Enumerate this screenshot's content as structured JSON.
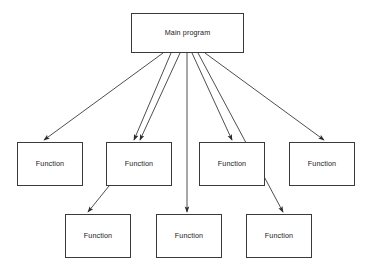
{
  "diagram": {
    "type": "flowchart-call-hierarchy",
    "title_text": "Main program",
    "background_color": "#ffffff",
    "line_color": "#3a3a3a",
    "text_color": "#1a1a1a",
    "root": {
      "id": "main-program",
      "label": "Main program",
      "x": 131,
      "y": 13,
      "w": 113,
      "h": 40
    },
    "middle_row": [
      {
        "id": "function-1",
        "label": "Function",
        "x": 17,
        "y": 142,
        "w": 66,
        "h": 44
      },
      {
        "id": "function-2",
        "label": "Function",
        "x": 106,
        "y": 142,
        "w": 66,
        "h": 44
      },
      {
        "id": "function-3",
        "label": "Function",
        "x": 199,
        "y": 142,
        "w": 66,
        "h": 44
      },
      {
        "id": "function-4",
        "label": "Function",
        "x": 289,
        "y": 142,
        "w": 66,
        "h": 44
      }
    ],
    "bottom_row": [
      {
        "id": "function-5",
        "label": "Function",
        "x": 65,
        "y": 214,
        "w": 66,
        "h": 44
      },
      {
        "id": "function-6",
        "label": "Function",
        "x": 156,
        "y": 214,
        "w": 66,
        "h": 44
      },
      {
        "id": "function-7",
        "label": "Function",
        "x": 246,
        "y": 214,
        "w": 66,
        "h": 44
      }
    ],
    "edges": [
      {
        "id": "edge-main-to-function-1",
        "from": "main-program",
        "to": "function-1",
        "x1": 163,
        "y1": 53,
        "x2": 44,
        "y2": 140
      },
      {
        "id": "edge-main-to-function-2a",
        "from": "main-program",
        "to": "function-2",
        "x1": 171,
        "y1": 53,
        "x2": 134,
        "y2": 140
      },
      {
        "id": "edge-main-to-function-2b",
        "from": "main-program",
        "to": "function-2",
        "x1": 180,
        "y1": 53,
        "x2": 140,
        "y2": 140
      },
      {
        "id": "edge-main-to-function-3",
        "from": "main-program",
        "to": "function-3",
        "x1": 192,
        "y1": 53,
        "x2": 232,
        "y2": 140
      },
      {
        "id": "edge-main-to-function-4",
        "from": "main-program",
        "to": "function-4",
        "x1": 205,
        "y1": 53,
        "x2": 324,
        "y2": 140
      },
      {
        "id": "edge-main-to-function-6",
        "from": "main-program",
        "to": "function-6",
        "x1": 187,
        "y1": 53,
        "x2": 187,
        "y2": 212
      },
      {
        "id": "edge-main-to-function-7",
        "from": "main-program",
        "to": "function-7",
        "x1": 198,
        "y1": 53,
        "x2": 283,
        "y2": 212
      },
      {
        "id": "edge-function-2-to-function-5",
        "from": "function-2",
        "to": "function-5",
        "x1": 109,
        "y1": 186,
        "x2": 88,
        "y2": 212
      }
    ]
  }
}
